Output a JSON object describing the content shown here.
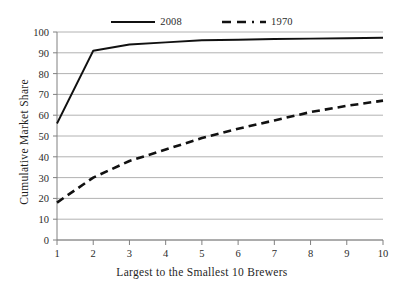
{
  "chart_data": {
    "type": "line",
    "title": "",
    "subtitle": "",
    "xlabel": "Largest to the Smallest 10 Brewers",
    "ylabel": "Cumulative Market Share",
    "x": [
      1,
      2,
      3,
      4,
      5,
      6,
      7,
      8,
      9,
      10
    ],
    "categories": [
      "1",
      "2",
      "3",
      "4",
      "5",
      "6",
      "7",
      "8",
      "9",
      "10"
    ],
    "xlim": [
      1,
      10
    ],
    "ylim": [
      0,
      100
    ],
    "ytick_values": [
      0,
      10,
      20,
      30,
      40,
      50,
      60,
      70,
      80,
      90,
      100
    ],
    "ytick_labels": [
      "0",
      "10",
      "20",
      "30",
      "40",
      "50",
      "60",
      "70",
      "80",
      "90",
      "100"
    ],
    "xtick_labels": [
      "1",
      "2",
      "3",
      "4",
      "5",
      "6",
      "7",
      "8",
      "9",
      "10"
    ],
    "grid": "horizontal",
    "legend_position": "top-center",
    "series": [
      {
        "name": "2008",
        "style": "solid",
        "color": "#111111",
        "values": [
          56,
          91,
          94,
          95,
          96,
          96.3,
          96.6,
          96.8,
          97,
          97.2
        ]
      },
      {
        "name": "1970",
        "style": "dashed",
        "color": "#111111",
        "values": [
          18,
          30,
          38,
          43.5,
          49,
          53.5,
          57.5,
          61.5,
          64.5,
          67
        ]
      }
    ]
  },
  "legend": {
    "entries": [
      {
        "label": "2008",
        "swatch": "solid-line-swatch"
      },
      {
        "label": "1970",
        "swatch": "dashed-line-swatch"
      }
    ]
  },
  "axes": {
    "x_title": "Largest to the Smallest 10 Brewers",
    "y_title": "Cumulative Market Share"
  },
  "colors": {
    "series": "#111111",
    "grid": "#a9a9a9",
    "axis": "#808080",
    "text": "#1f1f1f",
    "background": "#ffffff"
  }
}
